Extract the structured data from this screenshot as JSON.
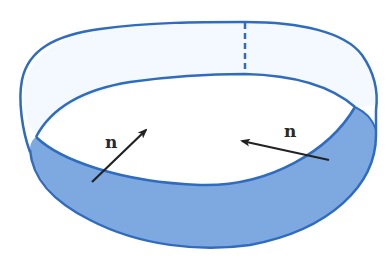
{
  "figure": {
    "type": "mobius-strip",
    "labels": {
      "left_normal": "n",
      "right_normal": "n"
    },
    "colors": {
      "outline": "#2f6cc0",
      "band_light": "#f4f9ff",
      "band_shaded": "#7ea8e0",
      "arrow": "#222222",
      "background": "#ffffff"
    }
  }
}
